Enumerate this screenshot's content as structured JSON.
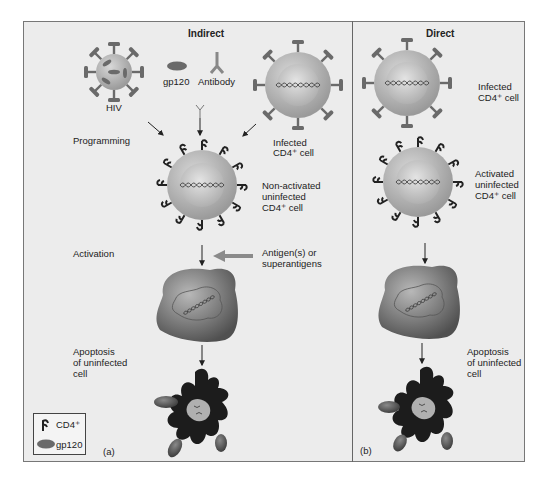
{
  "panels": {
    "indirect": {
      "title": "Indirect",
      "panel_label": "(a)",
      "labels": {
        "hiv": "HIV",
        "gp120": "gp120",
        "antibody": "Antibody",
        "infected_cell": [
          "Infected",
          "CD4⁺ cell"
        ],
        "programming": "Programming",
        "non_activated": [
          "Non-activated",
          "uninfected",
          "CD4⁺ cell"
        ],
        "activation": "Activation",
        "antigens": [
          "Antigen(s) or",
          "superantigens"
        ],
        "apoptosis": [
          "Apoptosis",
          "of uninfected",
          "cell"
        ]
      }
    },
    "direct": {
      "title": "Direct",
      "panel_label": "(b)",
      "labels": {
        "infected_cell": [
          "Infected",
          "CD4⁺ cell"
        ],
        "activated": [
          "Activated",
          "uninfected",
          "CD4⁺ cell"
        ],
        "apoptosis": [
          "Apoptosis",
          "of uninfected",
          "cell"
        ]
      }
    }
  },
  "legend": {
    "items": [
      {
        "icon": "cd4-receptor-icon",
        "label": "CD4⁺"
      },
      {
        "icon": "gp120-icon",
        "label": "gp120"
      }
    ]
  },
  "colors": {
    "background": "#ececec",
    "cell_outer": "#b4b4b4",
    "cell_nucleus": "#cfcfcf",
    "gp120": "#6a6a6a",
    "receptor": "#2a2a2a",
    "dark_cell": "#555555",
    "apoptotic": "#1c1c1c"
  }
}
